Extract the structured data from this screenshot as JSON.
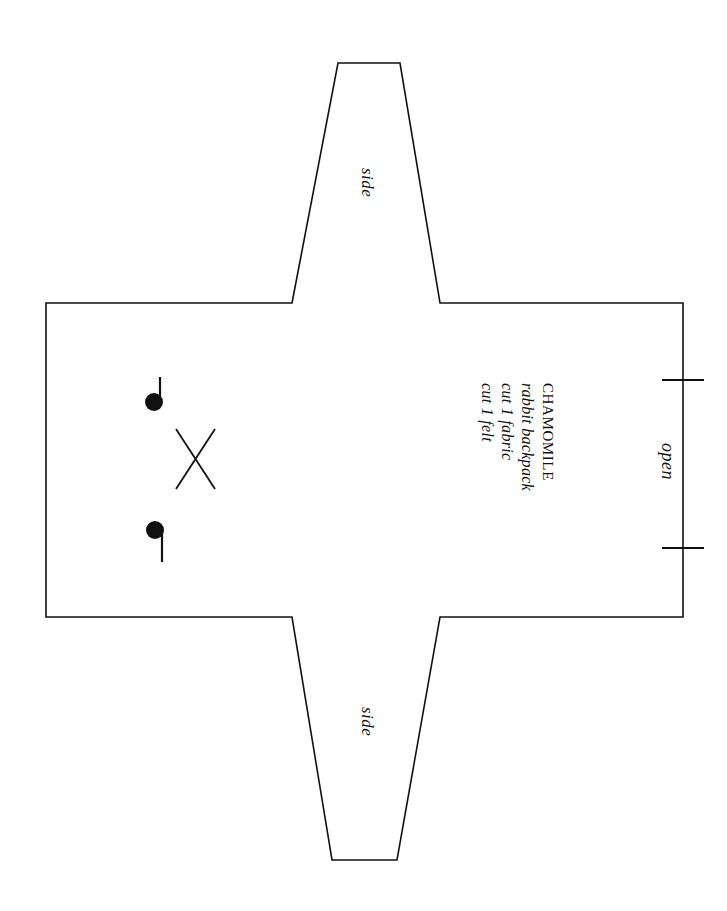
{
  "document": {
    "kind": "sewing-pattern-template",
    "background_color": "#ffffff",
    "line_color": "#111111"
  },
  "pattern": {
    "info_block": {
      "title": "CHAMOMILE",
      "lines": [
        "rabbit backpack",
        "cut 1 fabric",
        "cut 1 felt"
      ]
    },
    "labels": {
      "side_top": "side",
      "side_bottom": "side",
      "open": "open"
    },
    "markings": {
      "dot_top_label": "placement-dot",
      "dot_bottom_label": "placement-dot",
      "cross_label": "cross-mark",
      "notch_top_label": "notch",
      "notch_bottom_label": "notch"
    }
  },
  "geometry": {
    "outline_points": "292,303 338,63 400,63 440,303 683,303 683,617 440,617 397,860 332,860 292,617 46,617 46,303",
    "body": {
      "left": 46,
      "top": 303,
      "right": 683,
      "bottom": 617
    },
    "top_flap": {
      "top_y": 63,
      "top_left_x": 338,
      "top_right_x": 400,
      "base_left_x": 292,
      "base_right_x": 440
    },
    "bottom_flap": {
      "bottom_y": 860,
      "bottom_left_x": 332,
      "bottom_right_x": 397,
      "base_left_x": 292,
      "base_right_x": 440
    },
    "dots": [
      {
        "cx": 154,
        "cy": 402,
        "r": 9,
        "stem_x": 160,
        "stem_y1": 377,
        "stem_y2": 406
      },
      {
        "cx": 155,
        "cy": 530,
        "r": 9,
        "stem_x": 162,
        "stem_y1": 528,
        "stem_y2": 562
      }
    ],
    "cross": {
      "x1": 176,
      "y1": 429,
      "x2": 215,
      "y2": 489,
      "x3": 176,
      "y3": 489,
      "x4": 215,
      "y4": 429
    },
    "notches": [
      {
        "x1": 662,
        "x2": 704,
        "y": 380
      },
      {
        "x1": 662,
        "x2": 704,
        "y": 548
      }
    ]
  }
}
